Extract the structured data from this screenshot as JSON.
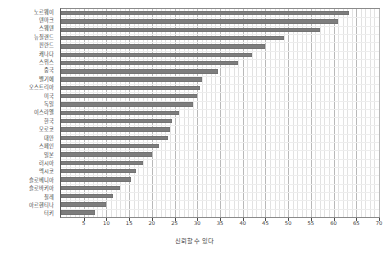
{
  "chart_data": {
    "type": "bar",
    "orientation": "horizontal",
    "title": "",
    "subtitle": "",
    "xlabel": "신뢰할 수 있다",
    "ylabel": "",
    "xlim": [
      0,
      70
    ],
    "ylim": null,
    "grid": true,
    "legend": false,
    "legend_position": "none",
    "xticks": [
      5,
      10,
      15,
      20,
      25,
      30,
      35,
      40,
      45,
      50,
      55,
      60,
      65,
      70
    ],
    "xtick_labels": [
      "5",
      "10",
      "15",
      "20",
      "25",
      "30",
      "35",
      "40",
      "45",
      "50",
      "55",
      "60",
      "65",
      "70"
    ],
    "bar_color": "#7d7d7d",
    "categories": [
      "노르웨이",
      "덴마크",
      "스웨덴",
      "뉴질랜드",
      "핀란드",
      "캐나다",
      "스위스",
      "중국",
      "벨기에",
      "오스트리아",
      "미국",
      "독일",
      "이스라엘",
      "한국",
      "모로코",
      "대만",
      "스페인",
      "일본",
      "러시아",
      "멕시코",
      "슬로베니아",
      "슬로바키아",
      "칠레",
      "아르헨티나",
      "터키"
    ],
    "values": [
      63.5,
      61.0,
      57.0,
      49.0,
      45.0,
      42.0,
      39.0,
      34.5,
      31.0,
      30.5,
      30.0,
      29.0,
      26.0,
      24.5,
      24.0,
      23.5,
      21.5,
      20.0,
      18.0,
      16.5,
      15.5,
      13.0,
      11.5,
      10.0,
      7.5
    ]
  },
  "axis": {
    "title": "신뢰할 수 있다"
  }
}
